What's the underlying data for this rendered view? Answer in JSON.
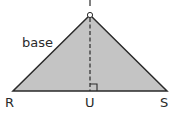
{
  "diagram": {
    "shape": "triangle",
    "fill_color": "#c4c4c4",
    "stroke_color": "#2a2a2a",
    "vertices": {
      "T": {
        "label": "T"
      },
      "R": {
        "label": "R"
      },
      "S": {
        "label": "S"
      }
    },
    "foot_point": {
      "label": "U"
    },
    "side_label": "base",
    "altitude": {
      "style": "dashed",
      "from": "T",
      "to": "U",
      "right_angle_marker": true
    },
    "apex_marker": "small circle"
  }
}
